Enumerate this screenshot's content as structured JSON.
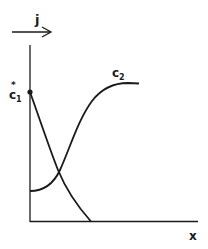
{
  "diagram": {
    "flux_label": "j",
    "x_axis_label": "x",
    "curves": [
      {
        "name": "c1",
        "label_main": "c",
        "label_sub": "1",
        "label_sup": "*",
        "start_point": "c1*"
      },
      {
        "name": "c2",
        "label_main": "c",
        "label_sub": "2"
      }
    ],
    "colors": {
      "ink": "#1a1a1a",
      "background": "#ffffff"
    }
  }
}
